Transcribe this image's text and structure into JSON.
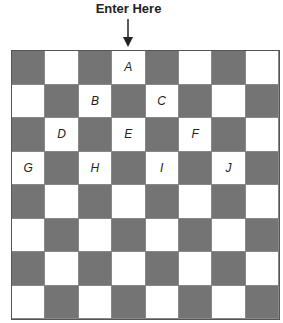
{
  "header": {
    "title": "Enter Here",
    "entry_arrow": "down-arrow-icon",
    "entry_column": 3
  },
  "board": {
    "rows": 8,
    "cols": 8,
    "pattern": "dark when (row+col) is even",
    "colors": {
      "dark": "#747474",
      "light": "#ffffff",
      "grid_line": "#888888"
    },
    "labels": [
      {
        "text": "A",
        "row": 0,
        "col": 3
      },
      {
        "text": "B",
        "row": 1,
        "col": 2
      },
      {
        "text": "C",
        "row": 1,
        "col": 4
      },
      {
        "text": "D",
        "row": 2,
        "col": 1
      },
      {
        "text": "E",
        "row": 2,
        "col": 3
      },
      {
        "text": "F",
        "row": 2,
        "col": 5
      },
      {
        "text": "G",
        "row": 3,
        "col": 0
      },
      {
        "text": "H",
        "row": 3,
        "col": 2
      },
      {
        "text": "I",
        "row": 3,
        "col": 4
      },
      {
        "text": "J",
        "row": 3,
        "col": 6
      }
    ]
  }
}
